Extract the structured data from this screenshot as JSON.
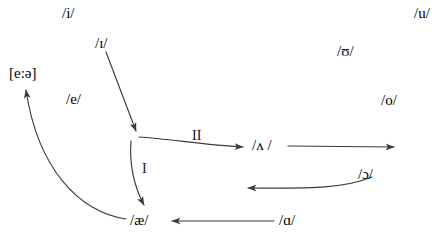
{
  "diagram": {
    "stroke_color": "#3a3a3a",
    "text_color": "#000000",
    "background": "#ffffff",
    "width": 447,
    "height": 249
  },
  "vowels": [
    {
      "id": "i",
      "text": "/i/",
      "x": 62,
      "y": 6
    },
    {
      "id": "u",
      "text": "/u/",
      "x": 414,
      "y": 6
    },
    {
      "id": "small-i",
      "text": "/ɪ/",
      "x": 95,
      "y": 36
    },
    {
      "id": "upsilon",
      "text": "/ʊ/",
      "x": 337,
      "y": 44
    },
    {
      "id": "e-long",
      "text": "[e:ə]",
      "x": 9,
      "y": 66
    },
    {
      "id": "e",
      "text": "/e/",
      "x": 66,
      "y": 92
    },
    {
      "id": "o",
      "text": "/o/",
      "x": 381,
      "y": 93
    },
    {
      "id": "wedge",
      "text": "/ʌ /",
      "x": 252,
      "y": 138
    },
    {
      "id": "open-o",
      "text": "/ɔ/",
      "x": 358,
      "y": 167
    },
    {
      "id": "ash",
      "text": "/æ/",
      "x": 130,
      "y": 213
    },
    {
      "id": "script-a",
      "text": "/ɑ/",
      "x": 279,
      "y": 213
    }
  ],
  "arrow_labels": [
    {
      "id": "shift-one",
      "text": "I",
      "x": 142,
      "y": 162
    },
    {
      "id": "shift-two",
      "text": "II",
      "x": 192,
      "y": 129
    }
  ],
  "arrows": [
    {
      "id": "arrow-small-i-to-center",
      "from": "/ɪ/",
      "to": "center",
      "path": "M 106 52 L 136 131"
    },
    {
      "id": "arrow-shift-one-center-to-ash",
      "from": "center",
      "to": "/æ/",
      "path": "M 131 141 C 129 168, 136 190, 144 205"
    },
    {
      "id": "arrow-shift-two-center-to-wedge",
      "from": "center",
      "to": "/ʌ/",
      "path": "M 139 137 C 170 139, 205 145, 243 147"
    },
    {
      "id": "arrow-wedge-to-right",
      "from": "/ʌ/",
      "to": "right-edge",
      "path": "M 288 146 L 394 147"
    },
    {
      "id": "arrow-open-o-to-left",
      "from": "/ɔ/",
      "to": "left",
      "path": "M 372 177 C 340 190, 300 188, 248 188"
    },
    {
      "id": "arrow-script-a-to-ash",
      "from": "/ɑ/",
      "to": "/æ/",
      "path": "M 274 221 L 172 221"
    },
    {
      "id": "arrow-ash-to-e-long",
      "from": "/æ/",
      "to": "[e:ə]",
      "path": "M 126 219 C 80 212, 38 170, 26 90"
    }
  ]
}
